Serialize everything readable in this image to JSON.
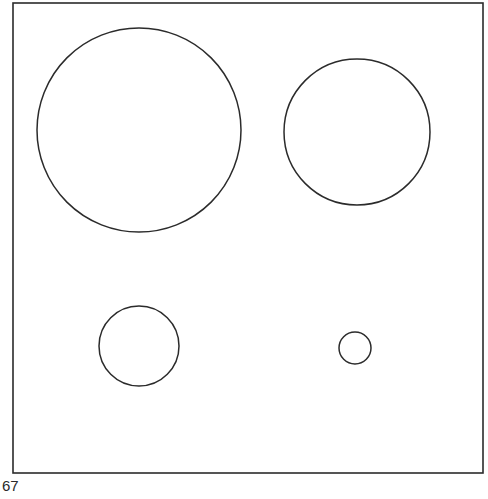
{
  "figure": {
    "label": "67",
    "stroke_color": "#2b2b2b",
    "background": "#ffffff",
    "frame": {
      "x": 13,
      "y": 3,
      "width": 470,
      "height": 470
    },
    "circles": [
      {
        "name": "large-circle",
        "cx": 139,
        "cy": 130,
        "r": 102
      },
      {
        "name": "medium-circle",
        "cx": 357,
        "cy": 132,
        "r": 73
      },
      {
        "name": "small-circle",
        "cx": 139,
        "cy": 346,
        "r": 40
      },
      {
        "name": "tiny-circle",
        "cx": 355,
        "cy": 348,
        "r": 16
      }
    ]
  }
}
